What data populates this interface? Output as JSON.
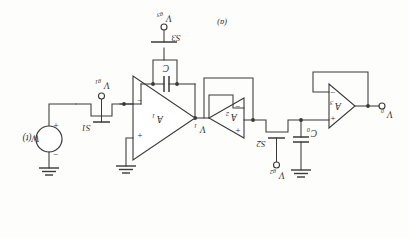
{
  "figure": {
    "caption": "(a)",
    "orientation_note": "upside-down scan",
    "ink_color": "#3a3a38",
    "paper_color": "#fdfdfc"
  },
  "opamps": [
    {
      "name": "A1",
      "label": "A",
      "sub": "1",
      "plus": "+",
      "minus": "−"
    },
    {
      "name": "A2",
      "label": "A",
      "sub": "2",
      "plus": "+",
      "minus": "−"
    },
    {
      "name": "A3",
      "label": "A",
      "sub": "3",
      "plus": "+",
      "minus": "−"
    }
  ],
  "switches": [
    {
      "name": "S1",
      "label": "S1",
      "gate": "V",
      "gate_sub": "g1"
    },
    {
      "name": "S2",
      "label": "S2",
      "gate": "V",
      "gate_sub": "g2"
    },
    {
      "name": "S3",
      "label": "S3",
      "gate": "V",
      "gate_sub": "g3"
    }
  ],
  "capacitors": [
    {
      "name": "C",
      "label": "C",
      "sub": ""
    },
    {
      "name": "C0",
      "label": "C",
      "sub": "0"
    }
  ],
  "source": {
    "name": "W(t)",
    "label": "W(t)",
    "plus": "+",
    "minus": "−"
  },
  "nodes": {
    "v1": {
      "label": "V",
      "sub": "1"
    },
    "vo": {
      "label": "V",
      "sub": "0"
    }
  },
  "terminals": [
    {
      "name": "output-terminal",
      "label": "V",
      "sub": "0"
    }
  ],
  "ground_symbol": "ground"
}
